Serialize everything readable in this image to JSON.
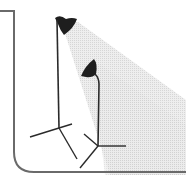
{
  "illustration": {
    "subject": "two studio lights on tripod stands",
    "colors": {
      "background": "#ffffff",
      "frame": "#6a6a6a",
      "stand": "#2a2a2a",
      "lamp_head": "#1e1e1e",
      "beam": "#d9d9d9"
    },
    "lights": [
      {
        "name": "tall-light",
        "icon": "studio-light-icon"
      },
      {
        "name": "short-light",
        "icon": "studio-light-icon"
      }
    ]
  }
}
